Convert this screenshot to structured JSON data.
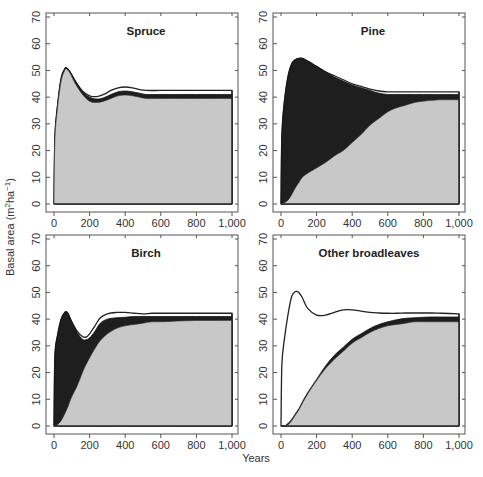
{
  "chart_data": {
    "type": "area",
    "xlabel": "Years",
    "ylabel": "Basal area (m²ha⁻¹)",
    "ylabel_parts": {
      "base": "Basal area (m",
      "sup1": "2",
      "mid": "ha",
      "sup2": "−1",
      "end": ")"
    },
    "xlim": [
      0,
      1000
    ],
    "ylim": [
      0,
      70
    ],
    "xticks": [
      0,
      200,
      400,
      600,
      800,
      1000
    ],
    "xtick_labels": [
      "0",
      "200",
      "400",
      "600",
      "800",
      "1,000"
    ],
    "yticks": [
      0,
      10,
      20,
      30,
      40,
      50,
      60,
      70
    ],
    "ytick_labels": [
      "0",
      "10",
      "20",
      "30",
      "40",
      "50",
      "60",
      "70"
    ],
    "colors": {
      "other": "#c8c8c8",
      "focal": "#1e1e1e",
      "gap": "#ffffff",
      "frame": "#555555"
    },
    "series_description": "Stacked: light gray = other species basal area; black band = focal species basal area; white line/band = total basal area envelope",
    "panels": [
      {
        "title": "Spruce",
        "x": [
          0,
          5,
          20,
          40,
          60,
          70,
          90,
          120,
          160,
          200,
          240,
          280,
          320,
          360,
          400,
          440,
          480,
          520,
          600,
          700,
          800,
          900,
          1000
        ],
        "lower": [
          0,
          24,
          36,
          46,
          50,
          50.5,
          49,
          45,
          41,
          38.5,
          38,
          38.5,
          39.5,
          40.5,
          40.8,
          40.5,
          40,
          39.5,
          39.5,
          39.5,
          39.5,
          39.5,
          39.5
        ],
        "upper": [
          0,
          25,
          37,
          47,
          50.5,
          51,
          49.5,
          46,
          42,
          40,
          39.3,
          39.8,
          41,
          42,
          42.3,
          42,
          41.5,
          41,
          41,
          41,
          41,
          41,
          41
        ],
        "total": [
          0,
          25,
          37,
          47,
          50.5,
          51,
          49.5,
          46,
          42.3,
          40.5,
          40.2,
          41,
          42.5,
          43.5,
          43.8,
          43.5,
          42.8,
          42.5,
          42.5,
          42.5,
          42.5,
          42.5,
          42.5
        ]
      },
      {
        "title": "Pine",
        "x": [
          0,
          5,
          20,
          40,
          60,
          80,
          100,
          120,
          150,
          200,
          250,
          300,
          350,
          400,
          450,
          500,
          550,
          600,
          650,
          700,
          750,
          800,
          850,
          900,
          1000
        ],
        "lower": [
          0,
          0,
          0.5,
          1.5,
          3.5,
          6,
          8,
          10,
          11.5,
          13.5,
          15.5,
          18,
          20,
          23,
          26,
          29.5,
          32,
          34.5,
          36,
          37,
          38,
          38.5,
          38.8,
          39,
          39
        ],
        "upper": [
          0,
          26,
          39,
          48,
          52.5,
          54,
          54.5,
          54.5,
          53.5,
          51.5,
          49.5,
          47.5,
          46,
          44.5,
          43.5,
          42.5,
          41.5,
          41,
          41,
          41,
          41,
          41,
          41,
          41,
          41
        ],
        "total": [
          0,
          26,
          39,
          48,
          52.5,
          54,
          54.5,
          54.5,
          53.5,
          51.5,
          49.5,
          48,
          46.5,
          45,
          44,
          43,
          42.3,
          42,
          42,
          42,
          42,
          42,
          42,
          42,
          42
        ]
      },
      {
        "title": "Birch",
        "x": [
          0,
          5,
          20,
          40,
          60,
          70,
          80,
          100,
          130,
          160,
          180,
          200,
          230,
          260,
          300,
          350,
          400,
          450,
          500,
          550,
          600,
          700,
          800,
          900,
          1000
        ],
        "lower": [
          0,
          0,
          0.5,
          2,
          4.5,
          6,
          7.5,
          11,
          15,
          20,
          23,
          25.5,
          29,
          32,
          34.5,
          36.5,
          37.5,
          38,
          38.5,
          39,
          39,
          39.3,
          39.5,
          39.5,
          39.5
        ],
        "upper": [
          0,
          26,
          34,
          40,
          42.5,
          42.7,
          42,
          39,
          35,
          32.5,
          32.3,
          33,
          35.5,
          38.5,
          40,
          40.5,
          40.7,
          41,
          41,
          41,
          41,
          41,
          41,
          41,
          41
        ],
        "total": [
          0,
          26,
          34,
          40,
          42.5,
          42.7,
          42,
          39,
          35.5,
          33.5,
          33.3,
          34.5,
          37.5,
          40.5,
          42,
          42.5,
          42.5,
          42.2,
          42,
          42.2,
          42.2,
          42.2,
          42.2,
          42.2,
          42.2
        ]
      },
      {
        "title": "Other broadleaves",
        "x": [
          0,
          5,
          20,
          40,
          60,
          80,
          100,
          120,
          150,
          200,
          250,
          300,
          350,
          400,
          450,
          500,
          550,
          600,
          650,
          700,
          750,
          800,
          850,
          900,
          1000
        ],
        "lower": [
          0,
          0,
          0,
          0.5,
          2,
          4,
          6,
          8.5,
          12,
          17,
          21.5,
          25,
          28,
          31,
          33,
          35,
          36.5,
          37.5,
          38,
          38.5,
          39,
          39,
          39,
          39,
          39
        ],
        "upper": [
          0,
          0,
          0,
          1,
          2.5,
          4.5,
          6.5,
          9,
          12.5,
          17.5,
          22.5,
          26.5,
          29.5,
          32.5,
          34.5,
          36.5,
          38,
          39,
          39.8,
          40.3,
          40.5,
          40.7,
          40.8,
          40.8,
          40.8
        ],
        "total": [
          0,
          23,
          33,
          42,
          48.5,
          50.3,
          50,
          48,
          44,
          41.5,
          41.5,
          42.5,
          43.5,
          43.5,
          43,
          42.5,
          42.3,
          42.2,
          42.2,
          42.3,
          42.3,
          42.3,
          42.3,
          42.2,
          42
        ]
      }
    ]
  }
}
